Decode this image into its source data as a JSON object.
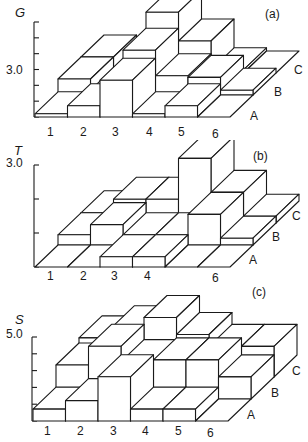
{
  "chart_data": [
    {
      "type": "bar3d",
      "panel": "(a)",
      "ylabel": "G",
      "ytick_label": "3.0",
      "ytick_value": 3.0,
      "ylim": [
        0,
        6
      ],
      "categories": [
        "1",
        "2",
        "3",
        "4",
        "5",
        "6"
      ],
      "rows": [
        "A",
        "B",
        "C"
      ],
      "series": [
        {
          "name": "A",
          "values": [
            0.2,
            0.7,
            2.3,
            0.2,
            0.7,
            0.0
          ]
        },
        {
          "name": "B",
          "values": [
            1.0,
            0.3,
            2.8,
            1.2,
            1.1,
            0.3
          ]
        },
        {
          "name": "C",
          "values": [
            1.0,
            0.2,
            3.8,
            2.0,
            0.2,
            0.0
          ]
        }
      ]
    },
    {
      "type": "bar3d",
      "panel": "(b)",
      "ylabel": "T",
      "ytick_label": "3.0",
      "ytick_value": 3.0,
      "ylim": [
        0,
        3
      ],
      "categories": [
        "1",
        "2",
        "3",
        "4",
        "5",
        "6"
      ],
      "rows": [
        "A",
        "B",
        "C"
      ],
      "series": [
        {
          "name": "A",
          "values": [
            0.0,
            0.0,
            0.3,
            0.3,
            0.0,
            0.0
          ]
        },
        {
          "name": "B",
          "values": [
            0.3,
            0.6,
            0.3,
            0.3,
            0.9,
            0.2
          ]
        },
        {
          "name": "C",
          "values": [
            0.3,
            0.7,
            0.7,
            1.9,
            0.9,
            0.2
          ]
        }
      ]
    },
    {
      "type": "bar3d",
      "panel": "(c)",
      "ylabel": "S",
      "ytick_label": "5.0",
      "ytick_value": 5.0,
      "ylim": [
        0,
        5
      ],
      "categories": [
        "1",
        "2",
        "3",
        "4",
        "5",
        "6"
      ],
      "rows": [
        "A",
        "B",
        "C"
      ],
      "series": [
        {
          "name": "A",
          "values": [
            0.7,
            1.2,
            2.6,
            0.7,
            0.7,
            0.0
          ]
        },
        {
          "name": "B",
          "values": [
            2.0,
            3.1,
            2.2,
            2.3,
            2.3,
            1.3
          ]
        },
        {
          "name": "C",
          "values": [
            2.3,
            2.9,
            3.5,
            2.5,
            1.8,
            1.8
          ]
        }
      ]
    }
  ],
  "panels": [
    {
      "tag": "(a)",
      "ylabel": "G",
      "ytick": "3.0",
      "xlabels": [
        "1",
        "2",
        "3",
        "4",
        "5",
        "6"
      ],
      "rowlabels": [
        "A",
        "B",
        "C"
      ]
    },
    {
      "tag": "(b)",
      "ylabel": "T",
      "ytick": "3.0",
      "xlabels": [
        "1",
        "2",
        "3",
        "4",
        "",
        "6"
      ],
      "rowlabels": [
        "A",
        "B",
        "C"
      ]
    },
    {
      "tag": "(c)",
      "ylabel": "S",
      "ytick": "5.0",
      "xlabels": [
        "1",
        "2",
        "3",
        "4",
        "5",
        "6"
      ],
      "rowlabels": [
        "A",
        "B",
        "C"
      ]
    }
  ]
}
